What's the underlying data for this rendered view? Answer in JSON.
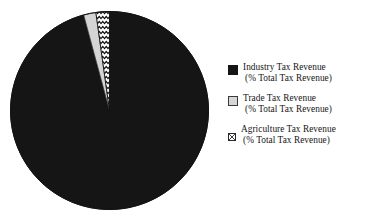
{
  "chart_data": {
    "type": "pie",
    "title": "",
    "subtitle": "",
    "xlabel": "",
    "ylabel": "",
    "grid": false,
    "legend_position": "right",
    "start_angle_deg": 0,
    "direction": "clockwise",
    "categories": [
      "Industry Tax Revenue (% Total Tax Revenue)",
      "Trade Tax Revenue (% Total Tax Revenue)",
      "Agriculture Tax Revenue (% Total Tax Revenue)"
    ],
    "values": [
      95.8,
      2.0,
      2.2
    ],
    "slices": [
      {
        "label": "Industry Tax Revenue",
        "sublabel": "(% Total Tax Revenue)",
        "value": 95.8,
        "sweep_deg": 344.9,
        "fill": "#151515",
        "pattern": "solid"
      },
      {
        "label": "Trade Tax Revenue",
        "sublabel": "(% Total Tax Revenue)",
        "value": 2.0,
        "sweep_deg": 7.2,
        "fill": "#d4d4d4",
        "pattern": "solid"
      },
      {
        "label": "Agriculture Tax Revenue",
        "sublabel": "(% Total Tax Revenue)",
        "value": 2.2,
        "sweep_deg": 7.9,
        "fill": "#ffffff",
        "pattern": "zigzag-wave"
      }
    ]
  },
  "legend": {
    "items": [
      {
        "swatch": "filled-black-square-icon",
        "line1": "Industry Tax Revenue",
        "line2": "(% Total Tax Revenue)",
        "color": "#151515"
      },
      {
        "swatch": "light-gray-square-icon",
        "line1": "Trade Tax Revenue",
        "line2": "(% Total Tax Revenue)",
        "color": "#d4d4d4"
      },
      {
        "swatch": "crosshatch-square-icon",
        "line1": "Agriculture Tax Revenue",
        "line2": "(% Total Tax Revenue)",
        "color": "#ffffff"
      }
    ]
  },
  "colors": {
    "industry": "#151515",
    "trade": "#d4d4d4",
    "agriculture": "#ffffff",
    "outline": "#111111",
    "background": "#ffffff",
    "text": "#151515"
  }
}
